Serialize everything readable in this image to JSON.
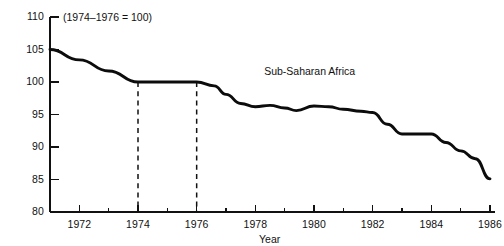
{
  "chart_data": {
    "type": "line",
    "title": "",
    "subtitle": "",
    "note": "(1974–1976 = 100)",
    "xlabel": "Year",
    "ylabel": "",
    "grid": false,
    "legend_position": "inline-label",
    "xlim": [
      1971,
      1986
    ],
    "ylim": [
      80,
      110
    ],
    "y_ticks": [
      80,
      85,
      90,
      95,
      100,
      105,
      110
    ],
    "y_tick_labels": [
      "80",
      "85",
      "90",
      "95",
      "100",
      "105",
      "110"
    ],
    "x_ticks": [
      1972,
      1974,
      1976,
      1978,
      1980,
      1982,
      1984,
      1986
    ],
    "x_tick_labels": [
      "1972",
      "1974",
      "1976",
      "1978",
      "1980",
      "1982",
      "1984",
      "1986"
    ],
    "x_minor_ticks": [
      1971,
      1973,
      1975,
      1977,
      1979,
      1981,
      1983,
      1985
    ],
    "reference_lines": [
      {
        "x": 1974,
        "style": "dashed",
        "from_y": 100,
        "to_y": 80
      },
      {
        "x": 1976,
        "style": "dashed",
        "from_y": 100,
        "to_y": 80
      }
    ],
    "series": [
      {
        "name": "Sub-Saharan Africa",
        "color": "#0c0c0c",
        "label_x": 1978.3,
        "label_y": 101.5,
        "x": [
          1971,
          1972,
          1973,
          1974,
          1975,
          1976,
          1976.6,
          1977,
          1977.5,
          1978,
          1978.5,
          1979,
          1979.4,
          1980,
          1980.5,
          1981,
          1981.6,
          1982,
          1982.5,
          1983,
          1983.6,
          1984,
          1984.5,
          1985,
          1985.5,
          1986
        ],
        "values": [
          105.0,
          103.4,
          101.7,
          100.0,
          100.0,
          100.0,
          99.4,
          98.1,
          96.7,
          96.2,
          96.4,
          96.0,
          95.6,
          96.3,
          96.2,
          95.8,
          95.5,
          95.3,
          93.5,
          92.0,
          92.0,
          92.0,
          90.7,
          89.4,
          88.2,
          85.1
        ]
      }
    ]
  },
  "geometry": {
    "plot_left": 50,
    "plot_right": 490,
    "plot_top": 17,
    "plot_bottom": 212
  },
  "annotations": {
    "note_label": "(1974–1976 = 100)",
    "series_label": "Sub-Saharan Africa",
    "x_axis_title": "Year"
  }
}
